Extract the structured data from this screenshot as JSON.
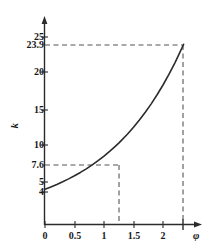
{
  "chart_data": {
    "type": "line",
    "title": "",
    "xlabel": "φ",
    "ylabel": "k",
    "xlim": [
      0,
      2.55
    ],
    "ylim": [
      0,
      26.2
    ],
    "grid": false,
    "legend": null,
    "x_ticks": [
      "0",
      "0.5",
      "1",
      "1.5",
      "2"
    ],
    "x_tick_values": [
      0,
      0.5,
      1,
      1.5,
      2
    ],
    "y_ticks": [
      "4",
      "5",
      "7.6",
      "10",
      "15",
      "20",
      "23.9",
      "25"
    ],
    "y_tick_values": [
      4,
      5,
      7.6,
      10,
      15,
      20,
      23.9,
      25
    ],
    "series": [
      {
        "name": "k(φ)",
        "x": [
          0,
          0.1,
          0.2,
          0.3,
          0.4,
          0.5,
          0.6,
          0.7,
          0.8,
          0.9,
          1.0,
          1.1,
          1.2,
          1.25,
          1.3,
          1.4,
          1.5,
          1.6,
          1.7,
          1.8,
          1.9,
          2.0,
          2.1,
          2.2,
          2.3,
          2.35
        ],
        "values": [
          4.0,
          4.32,
          4.66,
          5.03,
          5.43,
          5.86,
          6.32,
          6.82,
          7.36,
          7.94,
          8.57,
          9.25,
          9.99,
          10.37,
          10.78,
          11.63,
          12.55,
          13.55,
          14.62,
          15.78,
          17.03,
          18.38,
          19.84,
          21.41,
          23.11,
          24.0
        ]
      }
    ],
    "annotations": [
      {
        "name": "reference-point-low",
        "x": 1.25,
        "y": 7.6,
        "x_label": "",
        "y_label": "7.6",
        "style": "dashed"
      },
      {
        "name": "reference-point-high",
        "x": 2.35,
        "y": 23.9,
        "x_label": "",
        "y_label": "23.9",
        "style": "dashed"
      }
    ],
    "colors": {
      "curve": "#2b2b2b",
      "axis": "#2b2b2b",
      "dashed": "#555555",
      "text": "#1a1a1a",
      "background": "#ffffff"
    }
  },
  "axes": {
    "y_name": "k",
    "x_name": "φ"
  },
  "y_tick_labels": [
    {
      "text": "25",
      "top": 32,
      "right": 38
    },
    {
      "text": "23.9",
      "top": 40,
      "right": 38
    },
    {
      "text": "20",
      "top": 67,
      "right": 38
    },
    {
      "text": "15",
      "top": 105,
      "right": 38
    },
    {
      "text": "10",
      "top": 140,
      "right": 38
    },
    {
      "text": "7.6",
      "top": 160,
      "right": 38
    },
    {
      "text": "5",
      "top": 177,
      "right": 38
    },
    {
      "text": "4",
      "top": 187,
      "right": 38
    }
  ],
  "x_tick_labels": [
    {
      "text": "0",
      "left": 45
    },
    {
      "text": "0.5",
      "left": 76
    },
    {
      "text": "1",
      "left": 106
    },
    {
      "text": "1.5",
      "left": 136
    },
    {
      "text": "2",
      "left": 165
    }
  ]
}
